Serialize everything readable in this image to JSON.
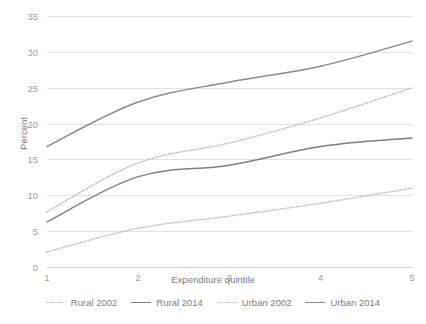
{
  "chart_data": {
    "type": "line",
    "title": "",
    "xlabel": "Expenditure quintile",
    "ylabel": "Percent",
    "categories": [
      "1",
      "2",
      "3",
      "4",
      "5"
    ],
    "x": [
      1,
      2,
      3,
      4,
      5
    ],
    "xlim": [
      1,
      5
    ],
    "ylim": [
      0,
      35
    ],
    "yticks": [
      0,
      5,
      10,
      15,
      20,
      25,
      30,
      35
    ],
    "ytick_labels": [
      "0",
      "5",
      "10",
      "15",
      "20",
      "25",
      "30",
      "35"
    ],
    "xtick_labels": [
      "1",
      "2",
      "3",
      "4",
      "5"
    ],
    "grid": "horizontal",
    "legend_position": "bottom",
    "series": [
      {
        "name": "Rural 2002",
        "style": "dotted",
        "color": "#b9b9b9",
        "values": [
          2.1,
          5.4,
          7.1,
          8.9,
          11.0
        ]
      },
      {
        "name": "Rural 2014",
        "style": "solid",
        "color": "#7f7f7f",
        "values": [
          6.3,
          12.6,
          14.2,
          16.8,
          18.0
        ]
      },
      {
        "name": "Urban 2002",
        "style": "dotted",
        "color": "#b9b9b9",
        "values": [
          7.7,
          14.5,
          17.3,
          20.8,
          25.0
        ]
      },
      {
        "name": "Urban 2014",
        "style": "solid",
        "color": "#8a8a8a",
        "values": [
          16.8,
          23.0,
          25.8,
          28.0,
          31.5
        ]
      }
    ]
  },
  "colors": {
    "background": "#ffffff",
    "gridline": "#e2e2e2",
    "axis": "#d0d0d0",
    "tick_text": "#9d9d9d",
    "label_text": "#7d7d7d",
    "solid_line": "#7f7f7f",
    "dotted_line": "#b9b9b9"
  }
}
